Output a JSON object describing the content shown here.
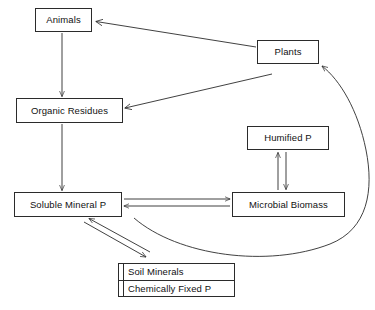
{
  "diagram": {
    "stroke_color": "#2b2b2b",
    "background_color": "#ffffff",
    "nodes": {
      "animals": {
        "label": "Animals"
      },
      "plants": {
        "label": "Plants"
      },
      "organic_residues": {
        "label": "Organic Residues"
      },
      "humified_p": {
        "label": "Humified P"
      },
      "soluble_mineral_p": {
        "label": "Soluble Mineral P"
      },
      "microbial_biomass": {
        "label": "Microbial Biomass"
      },
      "soil_minerals": {
        "line1": "Soil Minerals",
        "line2": "Chemically Fixed P"
      }
    },
    "edges": [
      {
        "from": "plants",
        "to": "animals",
        "style": "straight-arrow"
      },
      {
        "from": "animals",
        "to": "organic_residues",
        "style": "straight-arrow"
      },
      {
        "from": "plants",
        "to": "organic_residues",
        "style": "straight-arrow"
      },
      {
        "from": "organic_residues",
        "to": "soluble_mineral_p",
        "style": "straight-arrow"
      },
      {
        "from": "soluble_mineral_p",
        "to": "microbial_biomass",
        "style": "straight-arrow"
      },
      {
        "from": "microbial_biomass",
        "to": "soluble_mineral_p",
        "style": "straight-arrow"
      },
      {
        "from": "microbial_biomass",
        "to": "humified_p",
        "style": "straight-arrow"
      },
      {
        "from": "humified_p",
        "to": "microbial_biomass",
        "style": "straight-arrow"
      },
      {
        "from": "soluble_mineral_p",
        "to": "soil_minerals",
        "style": "straight-arrow"
      },
      {
        "from": "soil_minerals",
        "to": "soluble_mineral_p",
        "style": "straight-arrow"
      },
      {
        "from": "soluble_mineral_p",
        "to": "plants",
        "style": "curved-arrow"
      }
    ]
  }
}
